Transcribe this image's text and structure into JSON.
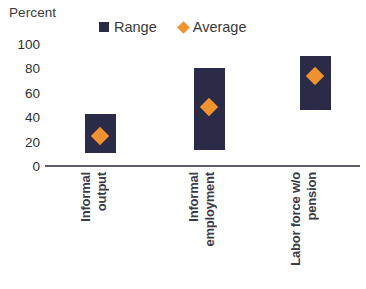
{
  "chart": {
    "type": "bar",
    "axis_title": "Percent",
    "legend": [
      {
        "label": "Range",
        "marker": "square-swatch-icon",
        "color": "#2b2b48"
      },
      {
        "label": "Average",
        "marker": "diamond-swatch-icon",
        "color": "#f0922d"
      }
    ]
  },
  "chart_data": {
    "type": "bar",
    "title": "",
    "subtitle": "",
    "xlabel": "",
    "ylabel": "Percent",
    "ylim": [
      0,
      100
    ],
    "yticks": [
      100,
      80,
      60,
      40,
      20,
      0
    ],
    "grid": false,
    "legend_position": "top",
    "categories": [
      "Informal output",
      "Informal employment",
      "Labor force w/o pension"
    ],
    "category_lines": [
      [
        "Informal",
        "output"
      ],
      [
        "Informal",
        "employment"
      ],
      [
        "Labor force w/o",
        "pension"
      ]
    ],
    "series": [
      {
        "name": "Range",
        "type": "range-bar",
        "color": "#2b2b48",
        "low": [
          11,
          13,
          46
        ],
        "high": [
          43,
          80,
          90
        ]
      },
      {
        "name": "Average",
        "type": "marker",
        "color": "#f0922d",
        "values": [
          25,
          48,
          74
        ]
      }
    ]
  }
}
